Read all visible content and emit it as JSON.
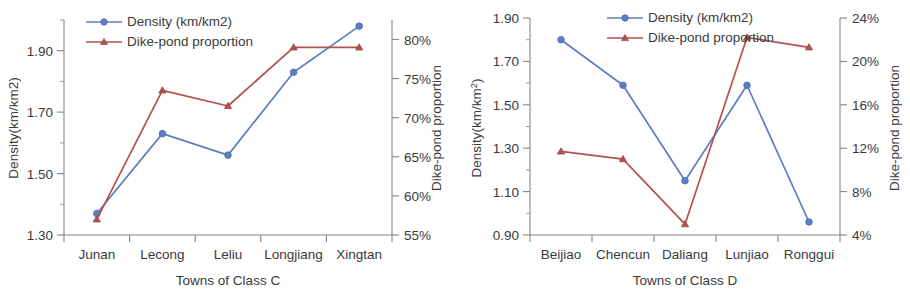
{
  "figure": {
    "panels": [
      "class_c",
      "class_d"
    ]
  },
  "chart_data": [
    {
      "id": "class_c",
      "type": "line",
      "title": "",
      "xlabel": "Towns of Class C",
      "ylabel": "Density(km/km2)",
      "y2label": "Dike-pond proportion",
      "categories": [
        "Junan",
        "Lecong",
        "Leliu",
        "Longjiang",
        "Xingtan"
      ],
      "ylim": [
        1.3,
        2.0
      ],
      "yticks": [
        "1.30",
        "1.50",
        "1.70",
        "1.90"
      ],
      "ytick_values": [
        1.3,
        1.5,
        1.7,
        1.9
      ],
      "y2lim": [
        55,
        82.5
      ],
      "y2ticks": [
        "55%",
        "60%",
        "65%",
        "70%",
        "75%",
        "80%"
      ],
      "y2tick_values": [
        55,
        60,
        65,
        70,
        75,
        80
      ],
      "grid": false,
      "legend_position": "top-left",
      "series": [
        {
          "name": "Density (km/km2)",
          "axis": "left",
          "color": "#5B7FC0",
          "marker": "circle",
          "values": [
            1.37,
            1.63,
            1.56,
            1.83,
            1.98
          ]
        },
        {
          "name": "Dike-pond proportion",
          "axis": "right",
          "color": "#B2524E",
          "marker": "triangle",
          "values": [
            57.0,
            73.5,
            71.5,
            79.0,
            79.0
          ]
        }
      ]
    },
    {
      "id": "class_d",
      "type": "line",
      "title": "",
      "xlabel": "Towns of Class D",
      "ylabel": "Density(km/km2)",
      "ylabel_base": "Density(km/km",
      "ylabel_sup": "2",
      "ylabel_tail": ")",
      "y2label": "Dike-pond proportion",
      "categories": [
        "Beijiao",
        "Chencun",
        "Daliang",
        "Lunjiao",
        "Ronggui"
      ],
      "ylim": [
        0.9,
        1.9
      ],
      "yticks": [
        "0.90",
        "1.10",
        "1.30",
        "1.50",
        "1.70",
        "1.90"
      ],
      "ytick_values": [
        0.9,
        1.1,
        1.3,
        1.5,
        1.7,
        1.9
      ],
      "y2lim": [
        4,
        24
      ],
      "y2ticks": [
        "4%",
        "8%",
        "12%",
        "16%",
        "20%",
        "24%"
      ],
      "y2tick_values": [
        4,
        8,
        12,
        16,
        20,
        24
      ],
      "grid": false,
      "legend_position": "top-center",
      "series": [
        {
          "name": "Density (km/km2)",
          "axis": "left",
          "color": "#5B7FC0",
          "marker": "circle",
          "values": [
            1.8,
            1.59,
            1.15,
            1.59,
            0.96
          ]
        },
        {
          "name": "Dike-pond proportion",
          "axis": "right",
          "color": "#B2524E",
          "marker": "triangle",
          "values": [
            11.7,
            11.0,
            5.0,
            22.2,
            21.3
          ]
        }
      ]
    }
  ],
  "colors": {
    "density": "#5B7FC0",
    "dikepond": "#B2524E",
    "axis": "#868686",
    "text": "#3a3a3a"
  }
}
